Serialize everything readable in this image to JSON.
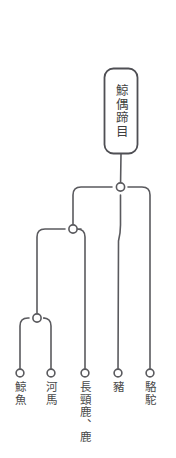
{
  "diagram": {
    "type": "cladogram",
    "title": "鯨偶蹄目",
    "root": {
      "label": "鯨偶蹄目",
      "shape": "rounded-rect",
      "x": 121,
      "box": {
        "left": 104,
        "top": 68,
        "width": 34,
        "height": 86
      }
    },
    "colors": {
      "line": "#5a5a5e",
      "node_fill": "#ffffff",
      "text": "#4a4a4a",
      "background": "#ffffff",
      "root_border": "#4f4f54"
    },
    "internal_nodes": [
      {
        "id": "n1",
        "x": 120,
        "y": 187
      },
      {
        "id": "n2",
        "x": 73,
        "y": 229
      },
      {
        "id": "n3",
        "x": 37,
        "y": 318
      }
    ],
    "leaves": [
      {
        "id": "l1",
        "label": "鯨魚",
        "x": 20,
        "y": 373
      },
      {
        "id": "l2",
        "label": "河馬",
        "x": 51,
        "y": 373
      },
      {
        "id": "l3",
        "label": "長頸鹿、鹿",
        "x": 85,
        "y": 373
      },
      {
        "id": "l4",
        "label": "豬",
        "x": 118,
        "y": 373
      },
      {
        "id": "l5",
        "label": "駱駝",
        "x": 150,
        "y": 373
      }
    ],
    "stem": {
      "x": 121,
      "top": 8,
      "bottom": 68
    }
  }
}
